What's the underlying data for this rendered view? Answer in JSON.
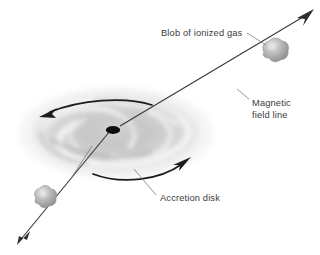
{
  "figure": {
    "background_color": "#ffffff"
  },
  "labels": {
    "blob": "Blob of ionized gas",
    "magnetic_line_1": "Magnetic",
    "magnetic_line_2": "field line",
    "accretion": "Accretion disk"
  },
  "colors": {
    "text": "#3b3b3b",
    "line": "#3a3a3a",
    "leader": "#6e6e6e",
    "black_hole": "#0d0d0d",
    "disk_dark": "#b9b9b9",
    "disk_mid": "#cfcfcf",
    "disk_light": "#ececec",
    "blob_fill": "#a9a9a9",
    "blob_light": "#e2e2e2"
  },
  "elements": {
    "black_hole": "black-hole-singularity",
    "disk": "accretion-disk",
    "field_line": "magnetic-field-line",
    "blob_upper": "ionized-gas-blob-upper",
    "blob_lower": "ionized-gas-blob-lower",
    "rotation_arrow_top": "rotation-arrow-top",
    "rotation_arrow_bottom": "rotation-arrow-bottom"
  }
}
